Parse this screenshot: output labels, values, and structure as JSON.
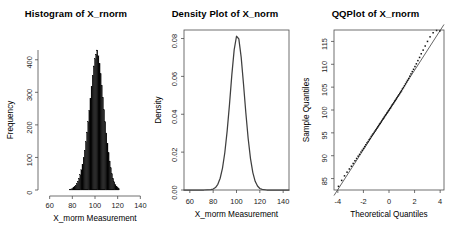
{
  "figure": {
    "background": "#ffffff",
    "panel_count": 3,
    "ink_color": "#000000",
    "axis_color": "#4d4d4d"
  },
  "chart_data": [
    {
      "type": "bar",
      "panel": "histogram",
      "title": "Histogram of X_rnorm",
      "xlabel": "X_morm Measurement",
      "ylabel": "Frequency",
      "xlim": [
        55,
        145
      ],
      "ylim": [
        0,
        430
      ],
      "xticks": [
        60,
        80,
        100,
        120,
        140
      ],
      "yticks": [
        0,
        100,
        200,
        300,
        400
      ],
      "grid": false,
      "legend": "none",
      "bar_color": "#050505",
      "bin_width": 1,
      "bin_centers": [
        78,
        79,
        80,
        81,
        82,
        83,
        84,
        85,
        86,
        87,
        88,
        89,
        90,
        91,
        92,
        93,
        94,
        95,
        96,
        97,
        98,
        99,
        100,
        101,
        102,
        103,
        104,
        105,
        106,
        107,
        108,
        109,
        110,
        111,
        112,
        113,
        114,
        115,
        116,
        117,
        118,
        119,
        120,
        121
      ],
      "values": [
        2,
        3,
        5,
        7,
        10,
        14,
        20,
        27,
        36,
        47,
        62,
        79,
        99,
        122,
        148,
        178,
        210,
        245,
        282,
        318,
        352,
        381,
        403,
        417,
        430,
        412,
        388,
        357,
        322,
        285,
        247,
        210,
        175,
        143,
        114,
        89,
        68,
        50,
        36,
        25,
        17,
        11,
        7,
        4
      ]
    },
    {
      "type": "line",
      "panel": "density",
      "title": "Density Plot of X_norm",
      "xlabel": "X_morm Measurement",
      "ylabel": "Density",
      "xlim": [
        55,
        145
      ],
      "ylim": [
        0,
        0.0845
      ],
      "xticks": [
        60,
        80,
        100,
        120,
        140
      ],
      "yticks": [
        0.0,
        0.02,
        0.04,
        0.06,
        0.08
      ],
      "ytick_labels": [
        "0.00",
        "0.02",
        "0.04",
        "0.06",
        "0.08"
      ],
      "grid": false,
      "legend": "none",
      "line_color": "#3f3f3f",
      "peak_x": 100,
      "peak_y": 0.0812,
      "x": [
        78,
        80,
        82,
        84,
        86,
        88,
        90,
        92,
        94,
        96,
        98,
        100,
        102,
        104,
        106,
        108,
        110,
        112,
        114,
        116,
        118,
        120,
        122
      ],
      "y": [
        0.0002,
        0.0005,
        0.0013,
        0.003,
        0.0062,
        0.0116,
        0.0198,
        0.0312,
        0.0452,
        0.0608,
        0.074,
        0.0812,
        0.0798,
        0.0702,
        0.056,
        0.0408,
        0.0272,
        0.0166,
        0.0092,
        0.0046,
        0.0021,
        0.0008,
        0.0003
      ]
    },
    {
      "type": "scatter",
      "panel": "qqplot",
      "title": "QQPlot of X_rnorm",
      "xlabel": "Theoretical Quantiles",
      "ylabel": "Sample Quantiles",
      "xlim": [
        -4.3,
        4.3
      ],
      "ylim": [
        82.5,
        117.5
      ],
      "xticks": [
        -4,
        -2,
        0,
        2,
        4
      ],
      "yticks": [
        85,
        90,
        95,
        100,
        105,
        110,
        115
      ],
      "grid": false,
      "legend": "none",
      "point_color": "#111111",
      "reference_line": {
        "slope": 4.35,
        "intercept": 100.0,
        "color": "#4a4a4a"
      },
      "x": [
        -3.95,
        -3.7,
        -3.48,
        -3.28,
        -3.1,
        -2.94,
        -2.8,
        -2.66,
        -2.53,
        -2.41,
        -2.3,
        -2.19,
        -2.09,
        -1.99,
        -1.9,
        -1.81,
        -1.72,
        -1.63,
        -1.55,
        -1.47,
        -1.39,
        -1.31,
        -1.24,
        -1.16,
        -1.09,
        -1.02,
        -0.95,
        -0.88,
        -0.81,
        -0.74,
        -0.68,
        -0.61,
        -0.55,
        -0.48,
        -0.42,
        -0.36,
        -0.29,
        -0.23,
        -0.17,
        -0.11,
        -0.05,
        0.01,
        0.07,
        0.13,
        0.19,
        0.25,
        0.31,
        0.38,
        0.44,
        0.5,
        0.57,
        0.63,
        0.7,
        0.77,
        0.84,
        0.91,
        0.98,
        1.05,
        1.13,
        1.21,
        1.29,
        1.37,
        1.45,
        1.54,
        1.63,
        1.72,
        1.82,
        1.92,
        2.03,
        2.14,
        2.26,
        2.39,
        2.52,
        2.67,
        2.83,
        3.01,
        3.21,
        3.45,
        3.72,
        3.98
      ],
      "y": [
        83.3,
        84.6,
        85.6,
        86.4,
        87.1,
        87.7,
        88.3,
        88.9,
        89.4,
        89.9,
        90.3,
        90.8,
        91.2,
        91.6,
        92.0,
        92.4,
        92.8,
        93.1,
        93.5,
        93.8,
        94.2,
        94.5,
        94.8,
        95.1,
        95.4,
        95.7,
        96.0,
        96.3,
        96.6,
        96.9,
        97.1,
        97.4,
        97.7,
        98.0,
        98.2,
        98.5,
        98.8,
        99.0,
        99.3,
        99.5,
        99.8,
        100.0,
        100.3,
        100.5,
        100.8,
        101.1,
        101.3,
        101.6,
        101.9,
        102.1,
        102.4,
        102.7,
        103.0,
        103.3,
        103.6,
        103.9,
        104.2,
        104.6,
        104.9,
        105.3,
        105.7,
        106.1,
        106.5,
        106.9,
        107.4,
        107.9,
        108.4,
        108.9,
        109.5,
        110.1,
        110.8,
        111.5,
        112.3,
        113.1,
        114.0,
        115.0,
        116.0,
        116.9,
        117.4,
        117.3
      ]
    }
  ]
}
